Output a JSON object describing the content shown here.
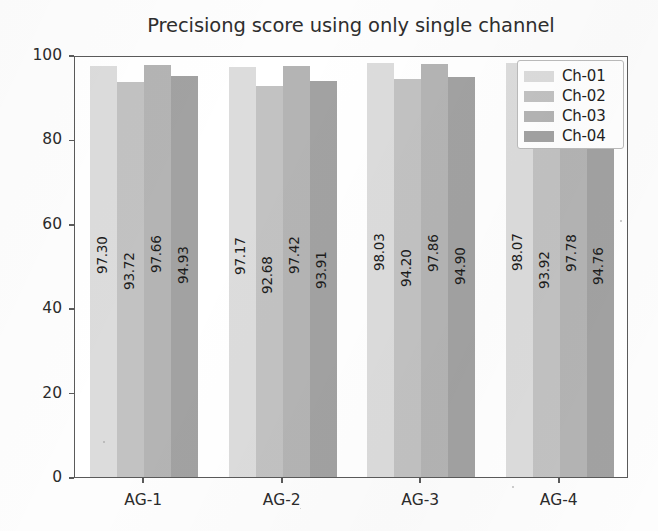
{
  "chart_data": {
    "type": "bar",
    "title": "Precisiong score using only single channel",
    "xlabel": "",
    "ylabel": "",
    "categories": [
      "AG-1",
      "AG-2",
      "AG-3",
      "AG-4"
    ],
    "series": [
      {
        "name": "Ch-01",
        "color": "#dcdcdc",
        "values": [
          97.3,
          97.17,
          98.03,
          98.07
        ]
      },
      {
        "name": "Ch-02",
        "color": "#c2c2c2",
        "values": [
          93.72,
          92.68,
          94.2,
          93.92
        ]
      },
      {
        "name": "Ch-03",
        "color": "#b4b4b4",
        "values": [
          97.66,
          97.42,
          97.86,
          97.78
        ]
      },
      {
        "name": "Ch-04",
        "color": "#a2a2a2",
        "values": [
          94.93,
          93.91,
          94.9,
          94.76
        ]
      }
    ],
    "value_labels": [
      [
        "97.30",
        "93.72",
        "97.66",
        "94.93"
      ],
      [
        "97.17",
        "92.68",
        "97.42",
        "93.91"
      ],
      [
        "98.03",
        "94.20",
        "97.86",
        "94.90"
      ],
      [
        "98.07",
        "93.92",
        "97.78",
        "94.76"
      ]
    ],
    "yticks": [
      0,
      20,
      40,
      60,
      80,
      100
    ],
    "ytick_labels": [
      "0",
      "20",
      "40",
      "60",
      "80",
      "100"
    ],
    "ylim": [
      0,
      100
    ],
    "grid": false,
    "legend": {
      "position": "upper right",
      "entries": [
        "Ch-01",
        "Ch-02",
        "Ch-03",
        "Ch-04"
      ]
    }
  }
}
